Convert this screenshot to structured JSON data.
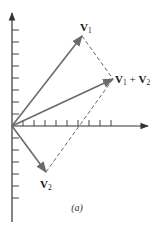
{
  "diagram": {
    "caption": "(a)",
    "origin": {
      "x": 12,
      "y": 126
    },
    "axes": {
      "x_axis": {
        "x1": 12,
        "y1": 126,
        "x2": 148,
        "y2": 126,
        "tick_count": 9,
        "tick_spacing": 11,
        "tick_length": 6
      },
      "y_axis": {
        "x1": 12,
        "y1": 222,
        "x2": 12,
        "y2": 13,
        "ticks_above": 8,
        "ticks_below": 6,
        "tick_spacing": 12,
        "tick_length": 7
      }
    },
    "vectors": [
      {
        "id": "v1",
        "label_main": "V",
        "label_sub": "1",
        "tip": {
          "x": 82,
          "y": 36
        },
        "label_pos": {
          "x": 80,
          "y": 31
        }
      },
      {
        "id": "v2",
        "label_main": "V",
        "label_sub": "2",
        "tip": {
          "x": 46,
          "y": 172
        },
        "label_pos": {
          "x": 40,
          "y": 188
        }
      },
      {
        "id": "v1_plus_v2",
        "label_main": "V",
        "label_sub": "1",
        "label_plus": " + ",
        "label_main2": "V",
        "label_sub2": "2",
        "tip": {
          "x": 113,
          "y": 79
        },
        "label_pos": {
          "x": 115,
          "y": 83
        }
      }
    ],
    "dashed_lines": [
      {
        "from": "v1",
        "to": "v1_plus_v2"
      },
      {
        "from": "v2",
        "to": "v1_plus_v2"
      }
    ],
    "colors": {
      "axis": "#333333",
      "vector": "#6b6b6b",
      "dashed": "#555555",
      "text": "#1a1a1a"
    }
  }
}
